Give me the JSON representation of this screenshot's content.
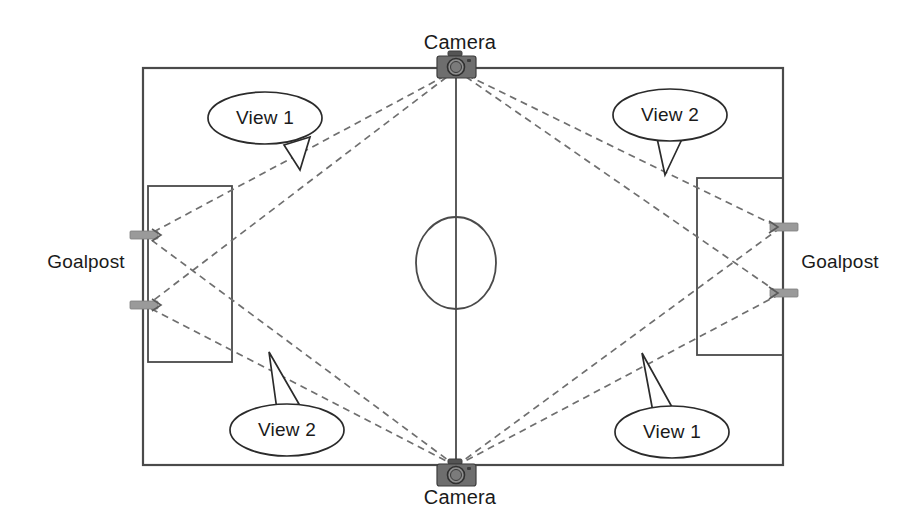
{
  "diagram": {
    "colors": {
      "field_line": "#4a4a4a",
      "sight_line": "#6f6f6f",
      "camera_body": "#6e6e6e",
      "goalpost_marker": "#9a9a9a",
      "text": "#1a1a1a",
      "background": "#ffffff"
    },
    "cameras": [
      {
        "id": "camera-top",
        "label": "Camera",
        "x": 456,
        "y": 66,
        "label_x": 460,
        "label_y": 42
      },
      {
        "id": "camera-bottom",
        "label": "Camera",
        "x": 456,
        "y": 470,
        "label_x": 460,
        "label_y": 497
      }
    ],
    "goalposts": [
      {
        "id": "goalpost-left",
        "label": "Goalpost",
        "label_x": 86,
        "label_y": 262
      },
      {
        "id": "goalpost-right",
        "label": "Goalpost",
        "label_x": 840,
        "label_y": 262
      }
    ],
    "callouts": [
      {
        "id": "callout-top-left",
        "label": "View 1",
        "cx": 265,
        "cy": 118
      },
      {
        "id": "callout-top-right",
        "label": "View 2",
        "cx": 670,
        "cy": 115
      },
      {
        "id": "callout-bottom-left",
        "label": "View 2",
        "cx": 287,
        "cy": 430
      },
      {
        "id": "callout-bottom-right",
        "label": "View 1",
        "cx": 672,
        "cy": 432
      }
    ],
    "field": {
      "left": 143,
      "top": 68,
      "right": 783,
      "bottom": 465,
      "center_line_x": 456,
      "center_circle": {
        "cx": 456,
        "cy": 263,
        "rx": 40,
        "ry": 46
      }
    },
    "goal_boxes": [
      {
        "id": "goal-box-left",
        "left": 148,
        "top": 186,
        "right": 232,
        "bottom": 362
      },
      {
        "id": "goal-box-right",
        "left": 697,
        "top": 178,
        "right": 783,
        "bottom": 355
      }
    ],
    "post_markers": [
      {
        "id": "post-left-upper",
        "x": 143,
        "y": 235
      },
      {
        "id": "post-left-lower",
        "x": 143,
        "y": 305
      },
      {
        "id": "post-right-upper",
        "x": 783,
        "y": 227
      },
      {
        "id": "post-right-lower",
        "x": 783,
        "y": 293
      }
    ],
    "sight_lines": [
      {
        "id": "sight-top-cam-to-left-upper",
        "from": "camera-top",
        "to": "post-left-upper",
        "x1": 456,
        "y1": 70,
        "x2": 146,
        "y2": 236
      },
      {
        "id": "sight-top-cam-to-left-lower",
        "from": "camera-top",
        "to": "post-left-lower",
        "x1": 456,
        "y1": 70,
        "x2": 146,
        "y2": 306
      },
      {
        "id": "sight-top-cam-to-right-upper",
        "from": "camera-top",
        "to": "post-right-upper",
        "x1": 456,
        "y1": 70,
        "x2": 780,
        "y2": 228
      },
      {
        "id": "sight-top-cam-to-right-lower",
        "from": "camera-top",
        "to": "post-right-lower",
        "x1": 456,
        "y1": 70,
        "x2": 780,
        "y2": 294
      },
      {
        "id": "sight-bottom-cam-to-left-upper",
        "from": "camera-bottom",
        "to": "post-left-upper",
        "x1": 456,
        "y1": 466,
        "x2": 146,
        "y2": 236
      },
      {
        "id": "sight-bottom-cam-to-left-lower",
        "from": "camera-bottom",
        "to": "post-left-lower",
        "x1": 456,
        "y1": 466,
        "x2": 146,
        "y2": 306
      },
      {
        "id": "sight-bottom-cam-to-right-upper",
        "from": "camera-bottom",
        "to": "post-right-upper",
        "x1": 456,
        "y1": 466,
        "x2": 780,
        "y2": 228
      },
      {
        "id": "sight-bottom-cam-to-right-lower",
        "from": "camera-bottom",
        "to": "post-right-lower",
        "x1": 456,
        "y1": 466,
        "x2": 780,
        "y2": 294
      }
    ]
  }
}
